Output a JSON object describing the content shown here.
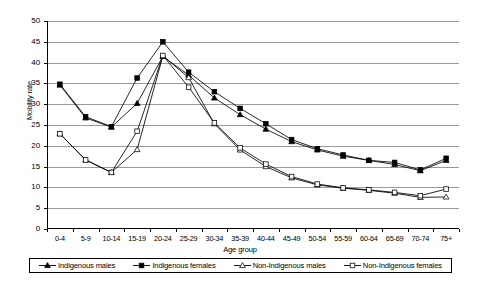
{
  "chart_data": {
    "type": "line",
    "title": "",
    "xlabel": "Age group",
    "ylabel": "Mobility rate",
    "ylim": [
      0,
      50
    ],
    "ytick_step": 5,
    "yticks": [
      "0",
      "5",
      "10",
      "15",
      "20",
      "25",
      "30",
      "35",
      "40",
      "45",
      "50"
    ],
    "grid": true,
    "legend_position": "bottom",
    "categories": [
      "0-4",
      "5-9",
      "10-14",
      "15-19",
      "20-24",
      "25-29",
      "30-34",
      "35-39",
      "40-44",
      "45-49",
      "50-54",
      "55-59",
      "60-64",
      "65-69",
      "70-74",
      "75+"
    ],
    "series": [
      {
        "name": "Indigenous males",
        "marker": "filled-triangle",
        "values": [
          34.6,
          26.7,
          24.5,
          30.2,
          41.5,
          37.0,
          31.5,
          27.5,
          24.0,
          21.0,
          19.0,
          17.5,
          16.5,
          15.5,
          14.0,
          16.5
        ]
      },
      {
        "name": "Indigenous females",
        "marker": "filled-square",
        "values": [
          34.8,
          27.0,
          24.6,
          36.3,
          45.0,
          37.7,
          33.0,
          29.0,
          25.3,
          21.5,
          19.3,
          17.8,
          16.5,
          16.0,
          14.2,
          17.0
        ]
      },
      {
        "name": "Non-Indigenous males",
        "marker": "open-triangle",
        "values": [
          22.9,
          16.6,
          13.6,
          19.1,
          41.6,
          36.4,
          25.3,
          19.0,
          15.0,
          12.3,
          10.6,
          9.8,
          9.3,
          8.6,
          7.6,
          7.7
        ]
      },
      {
        "name": "Non-Indigenous females",
        "marker": "open-square",
        "values": [
          22.9,
          16.6,
          13.6,
          23.5,
          41.7,
          34.1,
          25.5,
          19.5,
          15.6,
          12.6,
          10.8,
          9.9,
          9.4,
          8.8,
          8.0,
          9.6
        ]
      }
    ]
  },
  "legend": {
    "items": [
      {
        "label": "Indigenous males"
      },
      {
        "label": "Indigenous females"
      },
      {
        "label": "Non-Indigenous males"
      },
      {
        "label": "Non-Indigenous females"
      }
    ]
  },
  "colors": {
    "line": "#000000",
    "grid": "#9a9a9a",
    "background": "#ffffff"
  }
}
